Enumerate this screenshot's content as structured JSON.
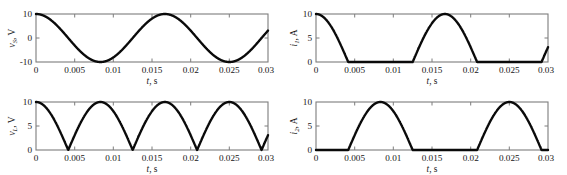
{
  "figure": {
    "background_color": "#ffffff",
    "curve_color": "#0a0a0a",
    "axis_color": "#7d7d7d",
    "panel_count": 4
  },
  "chart_data": [
    {
      "type": "line",
      "id": "source-voltage",
      "position": "top-left",
      "title": "",
      "xlabel": "t, s",
      "ylabel": "v_S, V",
      "ylabel_symbol": "v",
      "ylabel_subscript": "S",
      "ylabel_unit": "V",
      "xlabel_symbol": "t",
      "xlabel_unit": "s",
      "xlim": [
        0,
        0.03
      ],
      "ylim": [
        -10,
        10
      ],
      "xticks": [
        0,
        0.005,
        0.01,
        0.015,
        0.02,
        0.025,
        0.03
      ],
      "xticklabels": [
        "0",
        "0.005",
        "0.01",
        "0.015",
        "0.02",
        "0.025",
        "0.03"
      ],
      "yticks": [
        -10,
        0,
        10
      ],
      "yticklabels": [
        "-10",
        "0",
        "10"
      ],
      "grid": false,
      "legend": "none",
      "description": "Full sinusoid 10*cos(2*pi*60*t), amplitude 10 V, frequency 60 Hz, period 0.01667 s",
      "amplitude": 10,
      "frequency_hz": 60,
      "phase": "cosine",
      "waveform": "sine",
      "x": [
        0,
        0.000417,
        0.000833,
        0.00125,
        0.001667,
        0.002083,
        0.0025,
        0.002917,
        0.003333,
        0.00375,
        0.004167,
        0.004583,
        0.005,
        0.005417,
        0.005833,
        0.00625,
        0.006667,
        0.007083,
        0.0075,
        0.007917,
        0.008333,
        0.00875,
        0.009167,
        0.009583,
        0.01,
        0.010417,
        0.010833,
        0.01125,
        0.011667,
        0.012083,
        0.0125,
        0.012917,
        0.013333,
        0.01375,
        0.014167,
        0.014583,
        0.015,
        0.015417,
        0.015833,
        0.01625,
        0.016667,
        0.017083,
        0.0175,
        0.017917,
        0.018333,
        0.01875,
        0.019167,
        0.019583,
        0.02,
        0.020417,
        0.020833,
        0.02125,
        0.021667,
        0.022083,
        0.0225,
        0.022917,
        0.023333,
        0.02375,
        0.024167,
        0.024583,
        0.025,
        0.025417,
        0.025833,
        0.02625,
        0.026667,
        0.027083,
        0.0275,
        0.027917,
        0.028333,
        0.02875,
        0.029167,
        0.029583,
        0.03
      ],
      "y": [
        10,
        9.88,
        9.51,
        8.91,
        8.09,
        7.07,
        5.88,
        4.54,
        3.09,
        1.56,
        0,
        -1.56,
        -3.09,
        -4.54,
        -5.88,
        -7.07,
        -8.09,
        -8.91,
        -9.51,
        -9.88,
        -10,
        -9.88,
        -9.51,
        -8.91,
        -8.09,
        -7.07,
        -5.88,
        -4.54,
        -3.09,
        -1.56,
        0,
        1.56,
        3.09,
        4.54,
        5.88,
        7.07,
        8.09,
        8.91,
        9.51,
        9.88,
        10,
        9.88,
        9.51,
        8.91,
        8.09,
        7.07,
        5.88,
        4.54,
        3.09,
        1.56,
        0,
        -1.56,
        -3.09,
        -4.54,
        -5.88,
        -7.07,
        -8.09,
        -8.91,
        -9.51,
        -9.88,
        -10,
        -9.88,
        -9.51,
        -8.91,
        -8.09,
        -7.07,
        -5.88,
        -4.54,
        -3.09,
        -1.56,
        0,
        1.56,
        3.09
      ]
    },
    {
      "type": "line",
      "id": "current-i1",
      "position": "top-right",
      "title": "",
      "xlabel": "t, s",
      "ylabel": "i_1, A",
      "ylabel_symbol": "i",
      "ylabel_subscript": "1",
      "ylabel_unit": "A",
      "xlabel_symbol": "t",
      "xlabel_unit": "s",
      "xlim": [
        0,
        0.03
      ],
      "ylim": [
        0,
        10
      ],
      "xticks": [
        0,
        0.005,
        0.01,
        0.015,
        0.02,
        0.025,
        0.03
      ],
      "xticklabels": [
        "0",
        "0.005",
        "0.01",
        "0.015",
        "0.02",
        "0.025",
        "0.03"
      ],
      "yticks": [
        0,
        5,
        10
      ],
      "yticklabels": [
        "0",
        "5",
        "10"
      ],
      "grid": false,
      "legend": "none",
      "description": "Half-wave rectified: positive half-cycles of 10*cos(2*pi*60*t) only; conducts 0 to 0.00417 s, 0.0125 to 0.02083 s, and 0.02917 to 0.03 s",
      "amplitude": 10,
      "frequency_hz": 60,
      "waveform": "half-wave-rectified-cosine-positive",
      "conduction_intervals": [
        [
          0,
          0.004167
        ],
        [
          0.0125,
          0.020833
        ],
        [
          0.029167,
          0.03
        ]
      ]
    },
    {
      "type": "line",
      "id": "load-voltage",
      "position": "bottom-left",
      "title": "",
      "xlabel": "t, s",
      "ylabel": "v_L, V",
      "ylabel_symbol": "v",
      "ylabel_subscript": "L",
      "ylabel_unit": "V",
      "xlabel_symbol": "t",
      "xlabel_unit": "s",
      "xlim": [
        0,
        0.03
      ],
      "ylim": [
        0,
        10
      ],
      "xticks": [
        0,
        0.005,
        0.01,
        0.015,
        0.02,
        0.025,
        0.03
      ],
      "xticklabels": [
        "0",
        "0.005",
        "0.01",
        "0.015",
        "0.02",
        "0.025",
        "0.03"
      ],
      "yticks": [
        0,
        5,
        10
      ],
      "yticklabels": [
        "0",
        "5",
        "10"
      ],
      "grid": false,
      "legend": "none",
      "description": "Full-wave rectified sine |10*cos(2*pi*60*t)|, peaks 10 V at t = 0, 0.00833, 0.01667, 0.025; zeros at 0.00417, 0.0125, 0.02083, 0.02917",
      "amplitude": 10,
      "frequency_hz": 120,
      "waveform": "full-wave-rectified-cosine",
      "peak_times": [
        0,
        0.008333,
        0.016667,
        0.025
      ],
      "zero_times": [
        0.004167,
        0.0125,
        0.020833,
        0.029167
      ]
    },
    {
      "type": "line",
      "id": "current-i2",
      "position": "bottom-right",
      "title": "",
      "xlabel": "t, s",
      "ylabel": "i_2, A",
      "ylabel_symbol": "i",
      "ylabel_subscript": "2",
      "ylabel_unit": "A",
      "xlabel_symbol": "t",
      "xlabel_unit": "s",
      "xlim": [
        0,
        0.03
      ],
      "ylim": [
        0,
        10
      ],
      "xticks": [
        0,
        0.005,
        0.01,
        0.015,
        0.02,
        0.025,
        0.03
      ],
      "xticklabels": [
        "0",
        "0.005",
        "0.01",
        "0.015",
        "0.02",
        "0.025",
        "0.03"
      ],
      "yticks": [
        0,
        5,
        10
      ],
      "yticklabels": [
        "0",
        "5",
        "10"
      ],
      "grid": false,
      "legend": "none",
      "description": "Half-wave rectified: negative half-cycles inverted; conducts 0.00417 to 0.0125 s and 0.02083 to 0.02917 s, peaks 10 A at 0.00833 and 0.025",
      "amplitude": 10,
      "frequency_hz": 60,
      "waveform": "half-wave-rectified-cosine-negative",
      "conduction_intervals": [
        [
          0.004167,
          0.0125
        ],
        [
          0.020833,
          0.029167
        ]
      ]
    }
  ]
}
